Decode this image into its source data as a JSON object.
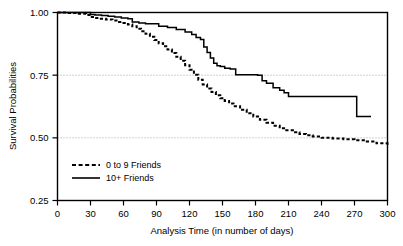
{
  "chart_data": {
    "type": "line",
    "title": "",
    "subtitle": "",
    "xlabel": "Analysis Time (in number of days)",
    "ylabel": "Survival Probabilities",
    "xlim": [
      0,
      300
    ],
    "ylim": [
      0.25,
      1.0
    ],
    "xticks": [
      0,
      30,
      60,
      90,
      120,
      150,
      180,
      210,
      240,
      270,
      300
    ],
    "xtick_labels": [
      "0",
      "30",
      "60",
      "90",
      "120",
      "150",
      "180",
      "210",
      "240",
      "270",
      "300"
    ],
    "yticks": [
      0.25,
      0.5,
      0.75,
      1.0
    ],
    "ytick_labels": [
      "0.25",
      "0.50",
      "0.75",
      "1.00"
    ],
    "grid": "horizontal-dotted at 0.50 and 0.75",
    "legend_position": "inside lower left",
    "step_style": "post",
    "series": [
      {
        "name": "0 to 9 Friends",
        "style": "dashed",
        "color": "#000000",
        "x": [
          0,
          8,
          18,
          26,
          30,
          34,
          38,
          44,
          50,
          56,
          60,
          64,
          68,
          72,
          76,
          80,
          84,
          88,
          92,
          96,
          100,
          104,
          108,
          112,
          116,
          120,
          124,
          128,
          132,
          136,
          140,
          144,
          148,
          152,
          156,
          160,
          166,
          172,
          178,
          184,
          190,
          196,
          202,
          208,
          214,
          220,
          226,
          232,
          240,
          250,
          260,
          270,
          280,
          290,
          300
        ],
        "y": [
          1.0,
          0.998,
          0.995,
          0.99,
          0.982,
          0.978,
          0.975,
          0.972,
          0.968,
          0.962,
          0.958,
          0.952,
          0.945,
          0.935,
          0.925,
          0.915,
          0.903,
          0.89,
          0.877,
          0.865,
          0.852,
          0.838,
          0.823,
          0.808,
          0.79,
          0.772,
          0.752,
          0.732,
          0.713,
          0.697,
          0.683,
          0.67,
          0.658,
          0.647,
          0.637,
          0.626,
          0.612,
          0.598,
          0.585,
          0.572,
          0.56,
          0.548,
          0.538,
          0.53,
          0.522,
          0.515,
          0.51,
          0.505,
          0.5,
          0.497,
          0.494,
          0.49,
          0.485,
          0.478,
          0.47
        ]
      },
      {
        "name": "10+ Friends",
        "style": "solid",
        "color": "#000000",
        "x": [
          0,
          26,
          30,
          34,
          40,
          46,
          52,
          58,
          64,
          68,
          74,
          80,
          92,
          100,
          108,
          116,
          122,
          126,
          130,
          133,
          136,
          139,
          142,
          145,
          148,
          152,
          157,
          162,
          182,
          186,
          190,
          196,
          202,
          206,
          210,
          268,
          272,
          285
        ],
        "y": [
          1.0,
          1.0,
          0.992,
          0.99,
          0.988,
          0.985,
          0.982,
          0.978,
          0.975,
          0.962,
          0.958,
          0.955,
          0.945,
          0.94,
          0.932,
          0.922,
          0.912,
          0.9,
          0.892,
          0.862,
          0.84,
          0.818,
          0.798,
          0.788,
          0.785,
          0.778,
          0.775,
          0.752,
          0.75,
          0.728,
          0.718,
          0.7,
          0.69,
          0.68,
          0.665,
          0.665,
          0.585,
          0.585
        ]
      }
    ]
  }
}
